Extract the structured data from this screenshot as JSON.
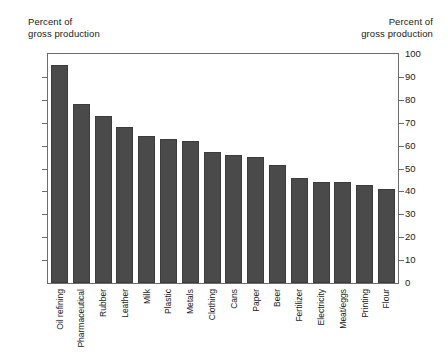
{
  "captions": {
    "left_line1": "Percent of",
    "left_line2": "gross production",
    "right_line1": "Percent of",
    "right_line2": "gross production"
  },
  "chart_data": {
    "type": "bar",
    "title": "",
    "subtitle": "",
    "xlabel": "",
    "ylabel": "Percent of gross production",
    "ylabel_right": "Percent of gross production",
    "ylim": [
      0,
      100
    ],
    "ytick_step": 10,
    "yticks": [
      0,
      10,
      20,
      30,
      40,
      50,
      60,
      70,
      80,
      90,
      100
    ],
    "ytick_labels": [
      "0",
      "10",
      "20",
      "30",
      "40",
      "50",
      "60",
      "70",
      "80",
      "90",
      "100"
    ],
    "grid": false,
    "legend": null,
    "legend_position": "none",
    "bar_color": "#4a4a4a",
    "bar_edge_color": "#3c3c3c",
    "axis_color": "#6d6d6d",
    "background": "#ffffff",
    "categories": [
      "Oil refining",
      "Pharmaceutical",
      "Rubber",
      "Leather",
      "Milk",
      "Plastic",
      "Metals",
      "Clothing",
      "Cans",
      "Paper",
      "Beer",
      "Fertilizer",
      "Electricity",
      "Meat/eggs",
      "Printing",
      "Flour"
    ],
    "values": [
      95,
      78,
      73,
      68,
      64,
      63,
      62,
      57,
      56,
      55,
      51.5,
      46,
      44,
      44,
      43,
      41
    ]
  }
}
